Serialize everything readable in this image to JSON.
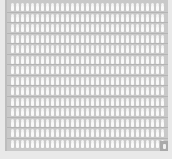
{
  "grid": {
    "columns": 31,
    "rows": 14,
    "item_icon": "person-icon",
    "highlight_cell": "bottom-right"
  },
  "colors": {
    "background": "#e9e9e9",
    "frame": "#c9c9c9",
    "item": "#fafafa",
    "highlight": "#a9a9a9"
  }
}
